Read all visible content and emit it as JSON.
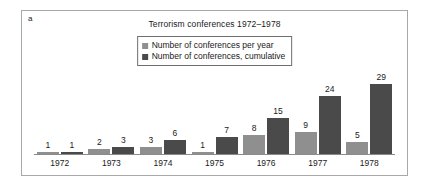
{
  "panel": {
    "letter": "a",
    "border_color": "#a8a8a8"
  },
  "chart_data": {
    "type": "bar",
    "title": "Terrorism conferences 1972–1978",
    "xlabel": "",
    "ylabel": "",
    "grid": false,
    "legend_position": "top-center",
    "ylim": [
      0,
      29
    ],
    "categories": [
      "1972",
      "1973",
      "1974",
      "1975",
      "1976",
      "1977",
      "1978"
    ],
    "series": [
      {
        "name": "Number of conferences per year",
        "color": "#8f8f8f",
        "values": [
          1,
          2,
          3,
          1,
          8,
          9,
          5
        ]
      },
      {
        "name": "Number of conferences, cumulative",
        "color": "#4a4a4a",
        "values": [
          1,
          3,
          6,
          7,
          15,
          24,
          29
        ]
      }
    ]
  }
}
